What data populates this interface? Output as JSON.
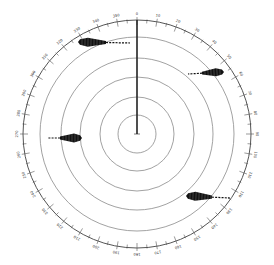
{
  "diagram": {
    "type": "radar-ppi-display",
    "center": [
      137,
      134
    ],
    "bearing_scale": {
      "radius": 114,
      "label_step_deg": 10,
      "tick_step_deg": 5,
      "labels": [
        "0",
        "10",
        "20",
        "30",
        "40",
        "50",
        "60",
        "70",
        "80",
        "90",
        "100",
        "110",
        "120",
        "130",
        "140",
        "150",
        "160",
        "170",
        "180",
        "190",
        "200",
        "210",
        "220",
        "230",
        "240",
        "250",
        "260",
        "270",
        "280",
        "290",
        "300",
        "310",
        "320",
        "330",
        "340",
        "350"
      ]
    },
    "range_rings": [
      19,
      37,
      57,
      76,
      97
    ],
    "heading_line": {
      "bearing_deg": 0,
      "length": 114
    },
    "echoes": [
      {
        "name": "echo-northwest",
        "x1": 80,
        "y1": 42,
        "x2": 130,
        "y2": 43,
        "head_len": 26,
        "thickness": 9
      },
      {
        "name": "echo-northeast",
        "x1": 222,
        "y1": 72,
        "x2": 188,
        "y2": 74,
        "head_len": 20,
        "thickness": 8
      },
      {
        "name": "echo-west",
        "x1": 80,
        "y1": 138,
        "x2": 48,
        "y2": 138,
        "head_len": 20,
        "thickness": 9
      },
      {
        "name": "echo-southeast",
        "x1": 188,
        "y1": 196,
        "x2": 230,
        "y2": 198,
        "head_len": 24,
        "thickness": 9
      }
    ],
    "colors": {
      "line": "#555555",
      "ring": "#8a8a8a",
      "echo": "#111111",
      "heading": "#222222"
    }
  }
}
